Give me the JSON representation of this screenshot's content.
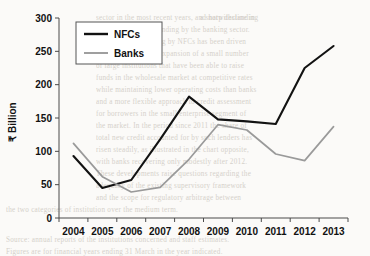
{
  "chart_data": {
    "type": "line",
    "title": "",
    "xlabel": "",
    "ylabel": "₹ Billion",
    "categories": [
      "2004",
      "2005",
      "2006",
      "2007",
      "2008",
      "2009",
      "2010",
      "2011",
      "2012",
      "2013"
    ],
    "series": [
      {
        "name": "NFCs",
        "color": "#121212",
        "values": [
          93,
          45,
          57,
          118,
          182,
          148,
          145,
          141,
          225,
          258
        ]
      },
      {
        "name": "Banks",
        "color": "#9a9a9a",
        "values": [
          112,
          62,
          39,
          46,
          88,
          140,
          132,
          96,
          86,
          137
        ]
      }
    ],
    "ylim": [
      0,
      300
    ],
    "yticks": [
      0,
      50,
      100,
      150,
      200,
      250,
      300
    ],
    "ytick_labels": [
      "0",
      "50",
      "100",
      "150",
      "200",
      "250",
      "300"
    ],
    "grid": false,
    "legend_position": "upper-left",
    "legend_entries": [
      "NFCs",
      "Banks"
    ]
  },
  "background_text": [
    {
      "x": 96,
      "y": 14,
      "text": "sector in the most recent years, and notwithstanding"
    },
    {
      "x": 200,
      "y": 14,
      "text": "a sharp decline in"
    },
    {
      "x": 96,
      "y": 26,
      "text": "the volume of new lending by the banking sector."
    },
    {
      "x": 96,
      "y": 38,
      "text": "The growth of lending by NFCs has been driven"
    },
    {
      "x": 96,
      "y": 50,
      "text": "largely by the rapid expansion of a small number"
    },
    {
      "x": 96,
      "y": 62,
      "text": "of large institutions that have been able to raise"
    },
    {
      "x": 96,
      "y": 74,
      "text": "funds in the wholesale market at competitive rates"
    },
    {
      "x": 96,
      "y": 86,
      "text": "while maintaining lower operating costs than banks"
    },
    {
      "x": 96,
      "y": 98,
      "text": "and a more flexible approach to credit assessment"
    },
    {
      "x": 96,
      "y": 110,
      "text": "for borrowers in the small enterprise segment of"
    },
    {
      "x": 96,
      "y": 122,
      "text": "the market. In the period since 2011 the share of"
    },
    {
      "x": 96,
      "y": 134,
      "text": "total new credit accounted for by such lenders has"
    },
    {
      "x": 96,
      "y": 146,
      "text": "risen steadily, as illustrated in the chart opposite,"
    },
    {
      "x": 96,
      "y": 158,
      "text": "with banks recovering only modestly after 2012."
    },
    {
      "x": 96,
      "y": 170,
      "text": "These developments raise questions regarding the"
    },
    {
      "x": 96,
      "y": 182,
      "text": "adequacy of the existing supervisory framework"
    },
    {
      "x": 96,
      "y": 194,
      "text": "and the scope for regulatory arbitrage between"
    },
    {
      "x": 6,
      "y": 206,
      "text": "the two categories of institution over the medium term."
    },
    {
      "x": 6,
      "y": 236,
      "text": "Source: annual reports of the institutions concerned and staff estimates."
    },
    {
      "x": 6,
      "y": 248,
      "text": "Figures are for financial years ending 31 March in the year indicated."
    }
  ]
}
